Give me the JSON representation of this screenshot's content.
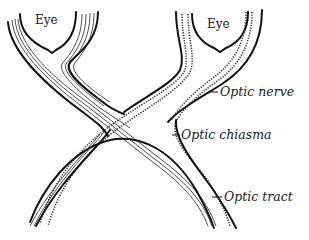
{
  "diagram": {
    "subject": "Optic chiasma",
    "colors": {
      "ink": "#111111",
      "background": "#ffffff"
    },
    "labels": {
      "eye_left": "Eye",
      "eye_right": "Eye",
      "optic_nerve": "Optic nerve",
      "optic_chiasma": "Optic chiasma",
      "optic_tract": "Optic tract"
    }
  }
}
